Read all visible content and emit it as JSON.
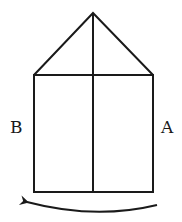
{
  "diagram": {
    "labels": {
      "left": "B",
      "right": "A"
    },
    "colors": {
      "stroke": "#1a1a1a",
      "background": "#ffffff"
    },
    "arrow": {
      "direction": "right-to-left",
      "from": "A",
      "to": "B"
    }
  }
}
